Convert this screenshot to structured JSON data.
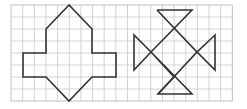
{
  "diagram": {
    "title": "",
    "grid": {
      "x0": 11,
      "y0": 5,
      "cell_w": 11.65,
      "cell_h": 12,
      "cols": 19,
      "rows": 8,
      "line_color": "#c8c8c8",
      "border_color": "#b0b0b0"
    },
    "shapes": [
      {
        "name": "arrow-cross-figure",
        "points": "69,5 46,29 46,53 23,53 23,77 46,77 69,101 92,77 116,77 116,53 92,53 92,29",
        "stroke": "#333333"
      },
      {
        "name": "hourglass-cross-figure",
        "paths": [
          "M157,10 L192,10 L151,52 L134,70 L134,35 L151,52 L174,77 L158,94 L192,94 L151,52",
          "M157,10 L197,52 L215,35 L215,70 L197,52 L158,94"
        ],
        "stroke": "#333333"
      }
    ]
  }
}
